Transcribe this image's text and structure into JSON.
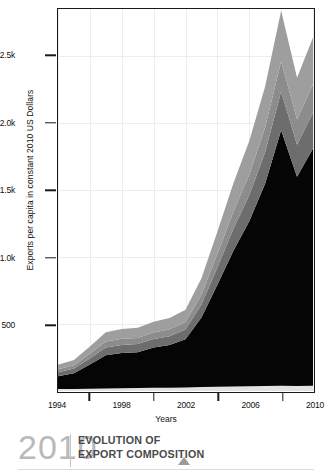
{
  "figure": {
    "ylabel": "Exports per capita in constant 2010 US Dollars",
    "xlabel": "Years"
  },
  "footer": {
    "year": "2010",
    "title_line1": "EVOLUTION OF",
    "title_line2": "EXPORT COMPOSITION",
    "triangle_icon": "triangle-up-icon",
    "year_color": "#b9b9b9",
    "title_color": "#4a4a4a"
  },
  "chart_data": {
    "type": "area",
    "title": "EVOLUTION OF EXPORT COMPOSITION",
    "xlabel": "Years",
    "ylabel": "Exports per capita in constant 2010 US Dollars",
    "xlim": [
      1994,
      2010
    ],
    "ylim": [
      0,
      2850
    ],
    "grid": true,
    "legend": "none",
    "stacked": true,
    "xtick_labels": [
      "1994",
      "1998",
      "2002",
      "2006",
      "2010"
    ],
    "xtick_values": [
      1994,
      1998,
      2002,
      2006,
      2010
    ],
    "xminor_ticks": [
      1996,
      2000,
      2004,
      2008
    ],
    "ytick_labels": [
      "500",
      "1.0k",
      "1.5k",
      "2.0k",
      "2.5k"
    ],
    "ytick_values": [
      500,
      1000,
      1500,
      2000,
      2500
    ],
    "x": [
      1994,
      1995,
      1996,
      1997,
      1998,
      1999,
      2000,
      2001,
      2002,
      2003,
      2004,
      2005,
      2006,
      2007,
      2008,
      2009,
      2010
    ],
    "series": [
      {
        "name": "layer-bottom-light",
        "color": "#e2e2e2",
        "values": [
          14,
          15,
          17,
          19,
          21,
          22,
          24,
          25,
          27,
          29,
          32,
          34,
          36,
          38,
          40,
          38,
          40
        ]
      },
      {
        "name": "layer-dominant-black",
        "color": "#050505",
        "values": [
          96,
          118,
          180,
          248,
          262,
          268,
          300,
          318,
          360,
          520,
          760,
          1010,
          1230,
          1510,
          1905,
          1560,
          1770
        ]
      },
      {
        "name": "layer-dark-gray",
        "color": "#6d6d6d",
        "values": [
          30,
          34,
          46,
          58,
          60,
          60,
          64,
          66,
          72,
          96,
          130,
          165,
          195,
          236,
          290,
          240,
          268
        ]
      },
      {
        "name": "layer-mid-gray",
        "color": "#8c8c8c",
        "values": [
          22,
          25,
          34,
          44,
          46,
          46,
          49,
          51,
          56,
          74,
          100,
          128,
          152,
          184,
          226,
          188,
          210
        ]
      },
      {
        "name": "layer-top-gray",
        "color": "#9e9e9e",
        "values": [
          34,
          39,
          55,
          70,
          74,
          75,
          80,
          84,
          92,
          122,
          166,
          212,
          252,
          306,
          376,
          312,
          350
        ]
      }
    ],
    "totals": [
      196,
      231,
      332,
      439,
      463,
      471,
      517,
      544,
      607,
      841,
      1188,
      1549,
      1865,
      2274,
      2837,
      2338,
      2638
    ]
  }
}
